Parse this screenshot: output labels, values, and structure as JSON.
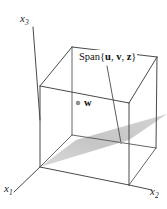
{
  "figure": {
    "caption_text": "Span{u, v, z}",
    "axes": [
      {
        "id": "x3",
        "label_base": "x",
        "label_sub": "3"
      },
      {
        "id": "x1",
        "label_base": "x",
        "label_sub": "1"
      },
      {
        "id": "x2",
        "label_base": "x",
        "label_sub": "2"
      }
    ],
    "span_label": {
      "prefix": "Span{",
      "vectors": [
        "u",
        "v",
        "z"
      ],
      "separator": ", ",
      "suffix": "}"
    },
    "point": {
      "name": "w",
      "label": "w"
    },
    "colors": {
      "line": "#4a4a4a",
      "plane_fill": "#c9c9c9",
      "text": "#101010",
      "background": "#ffffff",
      "point_fill": "#8c8c8c"
    },
    "geometry": {
      "cube": {
        "front_bottom_left": [
          40,
          167
        ],
        "front_bottom_right": [
          129,
          185
        ],
        "back_bottom_right": [
          156,
          148
        ],
        "back_bottom_left": [
          72,
          135
        ],
        "front_top_left": [
          40,
          86
        ],
        "front_top_right": [
          129,
          103
        ],
        "back_top_right": [
          157,
          57
        ],
        "back_top_left": [
          72,
          47
        ]
      },
      "plane": {
        "p1": [
          40,
          167
        ],
        "p2": [
          129,
          140
        ],
        "p3": [
          167,
          116
        ],
        "p4": [
          78,
          141
        ]
      },
      "axis_lines": {
        "x3": [
          [
            40,
            86
          ],
          [
            33,
            27
          ]
        ],
        "x1": [
          [
            40,
            167
          ],
          [
            16,
            190
          ]
        ],
        "x2": [
          [
            129,
            185
          ],
          [
            150,
            190
          ]
        ]
      },
      "leader_line": [
        [
          108,
          64
        ],
        [
          120,
          142
        ]
      ],
      "point_w": [
        78,
        102
      ]
    }
  }
}
